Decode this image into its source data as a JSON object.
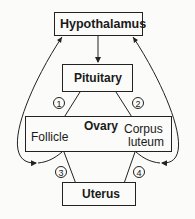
{
  "nodes": {
    "hypothalamus": "Hypothalamus",
    "pituitary": "Pituitary",
    "ovary": "Ovary",
    "follicle": "Follicle",
    "corpus_luteum_line1": "Corpus",
    "corpus_luteum_line2": "luteum",
    "uterus": "Uterus"
  },
  "pathways": [
    "1",
    "2",
    "3",
    "4"
  ],
  "colors": {
    "line": "#222222",
    "background": "#fbfbf9"
  }
}
